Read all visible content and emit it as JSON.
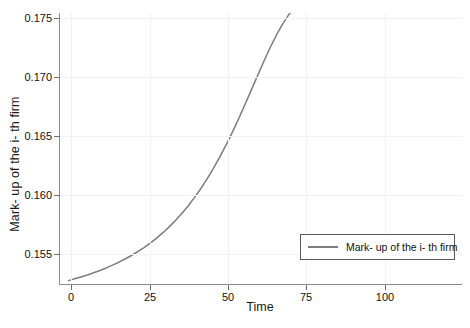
{
  "chart_data": {
    "type": "line",
    "title": "",
    "xlabel": "Time",
    "ylabel": "Mark- up of the i- th firm",
    "xlim": [
      -3,
      125
    ],
    "ylim": [
      0.1515,
      0.1762
    ],
    "xticks": [
      0,
      25,
      50,
      75,
      100
    ],
    "yticks": [
      0.155,
      0.16,
      0.165,
      0.17,
      0.175
    ],
    "ytick_labels": [
      "0.155",
      "0.160",
      "0.165",
      "0.170",
      "0.175"
    ],
    "xtick_labels": [
      "0",
      "25",
      "50",
      "75",
      "100"
    ],
    "grid": true,
    "legend_position": "lower right",
    "line_color": "#7d7d7d",
    "grid_color": "#f2f2f2",
    "axis_color": "#8d8d8d",
    "series": [
      {
        "name": "Mark- up of the i- th firm",
        "x": [
          0,
          2,
          4,
          6,
          8,
          10,
          12,
          14,
          16,
          18,
          20,
          22,
          24,
          26,
          28,
          30,
          32,
          34,
          36,
          38,
          40,
          42,
          44,
          46,
          48,
          50,
          52,
          54,
          56,
          58,
          60,
          62,
          64,
          66,
          68,
          70,
          72,
          74,
          76,
          78,
          80,
          82,
          84,
          86,
          88,
          90,
          92,
          94,
          96,
          98,
          100,
          104,
          108,
          112,
          116,
          120,
          124
        ],
        "y": [
          0.1519,
          0.15206,
          0.15223,
          0.15241,
          0.15261,
          0.15282,
          0.15305,
          0.1533,
          0.15357,
          0.15386,
          0.15418,
          0.15452,
          0.1549,
          0.15531,
          0.15576,
          0.15625,
          0.15678,
          0.15736,
          0.15799,
          0.15868,
          0.15943,
          0.16024,
          0.16112,
          0.16207,
          0.16309,
          0.16418,
          0.16534,
          0.16656,
          0.16784,
          0.16915,
          0.17047,
          0.17177,
          0.17302,
          0.17417,
          0.17519,
          0.17606,
          0.17678,
          0.17735,
          0.17779,
          0.17812,
          0.17836,
          0.17853,
          0.17865,
          0.17874,
          0.1788,
          0.17883,
          0.17886,
          0.17888,
          0.17889,
          0.1789,
          0.1789,
          0.17891,
          0.17891,
          0.17891,
          0.17891,
          0.17891,
          0.17891
        ]
      }
    ],
    "annotations": {
      "start_value": 0.1519,
      "plateau_value": 0.1752,
      "inflection_x": 62
    }
  },
  "legend": {
    "entries": [
      {
        "label": "Mark- up of the i- th firm"
      }
    ]
  },
  "axes": {
    "x_label": "Time",
    "y_label": "Mark- up of the i- th firm"
  }
}
